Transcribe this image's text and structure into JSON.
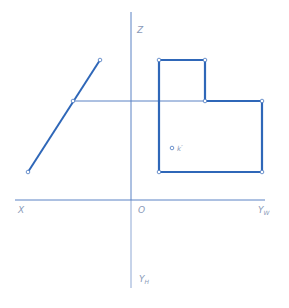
{
  "colors": {
    "axis": "#5b82c4",
    "edge": "#2f67b8",
    "label": "#8a9ab8",
    "background": "#ffffff"
  },
  "axes": {
    "z_label": "Z",
    "x_label": "X",
    "origin_label": "O",
    "yw_label": "Y",
    "yw_sub": "W",
    "yh_label": "Y",
    "yh_sub": "H"
  },
  "point_label": {
    "name": "k",
    "prime": "″"
  }
}
